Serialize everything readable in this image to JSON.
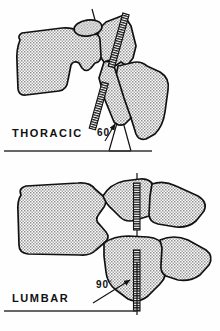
{
  "diagram": {
    "type": "anatomical-line-drawing",
    "background_color": "#fefefe",
    "line_color": "#111111",
    "bone_fill_color": "#b9b9b9",
    "panels": [
      {
        "id": "thoracic",
        "label": "THORACIC",
        "angle_value": "60",
        "degree_symbol": "°",
        "angle_label": "60°",
        "description": "Two thoracic vertebrae in lateral view with facet joint plane inclined 60 degrees from the horizontal baseline",
        "facet_count": 2,
        "reference_line": "oblique",
        "baseline_label": "horizontal-baseline"
      },
      {
        "id": "lumbar",
        "label": "LUMBAR",
        "angle_value": "90",
        "degree_symbol": "°",
        "angle_label": "90°",
        "description": "Two lumbar vertebrae in lateral view with facet joint plane vertical at 90 degrees from the horizontal baseline",
        "facet_count": 2,
        "reference_line": "vertical",
        "baseline_label": "horizontal-baseline"
      }
    ]
  }
}
